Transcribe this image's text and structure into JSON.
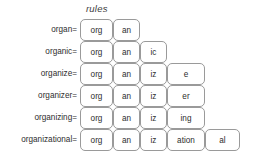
{
  "title": "rules",
  "columns_px": [
    80,
    113,
    140,
    167,
    205,
    240
  ],
  "grid": {
    "left": 80,
    "top": 19,
    "row_height": 22,
    "rows": 6
  },
  "colors": {
    "background": "#ffffff",
    "cell_fill": "#ffffff",
    "cell_border": "#9a9a9a",
    "text": "#2e2e2e",
    "title_text": "#3c3c3c"
  },
  "rows": [
    {
      "label": "organ=",
      "cells": [
        {
          "text": "org",
          "col": 0
        },
        {
          "text": "an",
          "col": 1
        }
      ]
    },
    {
      "label": "organic=",
      "cells": [
        {
          "text": "org",
          "col": 0
        },
        {
          "text": "an",
          "col": 1
        },
        {
          "text": "ic",
          "col": 2
        }
      ]
    },
    {
      "label": "organize=",
      "cells": [
        {
          "text": "org",
          "col": 0
        },
        {
          "text": "an",
          "col": 1
        },
        {
          "text": "iz",
          "col": 2
        },
        {
          "text": "e",
          "col": 3
        }
      ]
    },
    {
      "label": "organizer=",
      "cells": [
        {
          "text": "org",
          "col": 0
        },
        {
          "text": "an",
          "col": 1
        },
        {
          "text": "iz",
          "col": 2
        },
        {
          "text": "er",
          "col": 3
        }
      ]
    },
    {
      "label": "organizing=",
      "cells": [
        {
          "text": "org",
          "col": 0
        },
        {
          "text": "an",
          "col": 1
        },
        {
          "text": "iz",
          "col": 2
        },
        {
          "text": "ing",
          "col": 3
        }
      ]
    },
    {
      "label": "organizational=",
      "cells": [
        {
          "text": "org",
          "col": 0
        },
        {
          "text": "an",
          "col": 1
        },
        {
          "text": "iz",
          "col": 2
        },
        {
          "text": "ation",
          "col": 3
        },
        {
          "text": "al",
          "col": 4
        }
      ]
    }
  ]
}
